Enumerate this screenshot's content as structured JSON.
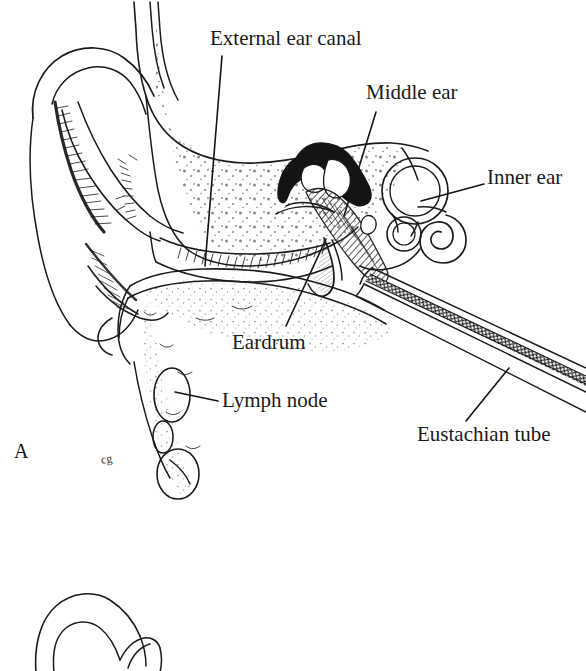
{
  "figure": {
    "panel_letter": "A",
    "stray_mark": "cg",
    "background_color": "#ffffff",
    "ink_color": "#1a1a1a",
    "width": 586,
    "height": 671
  },
  "labels": {
    "external_ear_canal": "External ear canal",
    "middle_ear": "Middle ear",
    "inner_ear": "Inner ear",
    "eardrum": "Eardrum",
    "lymph_node": "Lymph node",
    "eustachian_tube": "Eustachian tube"
  },
  "leader_lines": [
    {
      "name": "external-ear-canal-leader",
      "from": [
        222,
        56
      ],
      "to": [
        205,
        266
      ]
    },
    {
      "name": "middle-ear-leader",
      "from": [
        376,
        112
      ],
      "to": [
        344,
        216
      ]
    },
    {
      "name": "inner-ear-leader",
      "from": [
        484,
        184
      ],
      "to": [
        421,
        201
      ]
    },
    {
      "name": "eardrum-leader",
      "from": [
        326,
        239
      ],
      "to": [
        286,
        326
      ]
    },
    {
      "name": "lymph-node-leader",
      "from": [
        218,
        401
      ],
      "to": [
        175,
        392
      ]
    },
    {
      "name": "eustachian-tube-leader",
      "from": [
        509,
        368
      ],
      "to": [
        466,
        421
      ]
    }
  ],
  "structures": [
    "pinna-auricle",
    "external-ear-canal",
    "temporal-bone",
    "eardrum-tympanic-membrane",
    "middle-ear-ossicles",
    "semicircular-canals",
    "cochlea",
    "eustachian-tube",
    "lymph-node",
    "mastoid-process",
    "second-figure-partial"
  ]
}
